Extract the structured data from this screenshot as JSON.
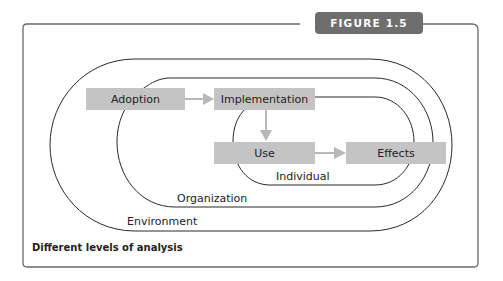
{
  "figure": {
    "badge": "FIGURE 1.5",
    "caption": "Different levels of analysis"
  },
  "diagram": {
    "nodes": [
      {
        "id": "adoption",
        "label": "Adoption"
      },
      {
        "id": "implementation",
        "label": "Implementation"
      },
      {
        "id": "use",
        "label": "Use"
      },
      {
        "id": "effects",
        "label": "Effects"
      }
    ],
    "edges": [
      {
        "from": "adoption",
        "to": "implementation"
      },
      {
        "from": "implementation",
        "to": "use"
      },
      {
        "from": "use",
        "to": "effects"
      }
    ],
    "levels": [
      {
        "id": "individual",
        "label": "Individual"
      },
      {
        "id": "organization",
        "label": "Organization"
      },
      {
        "id": "environment",
        "label": "Environment"
      }
    ]
  },
  "colors": {
    "box_fill": "#c4c4c4",
    "arrow": "#b8b8b8",
    "badge": "#6e6e6e",
    "frame": "#6a6a6a",
    "ring": "#2a2a2a"
  }
}
